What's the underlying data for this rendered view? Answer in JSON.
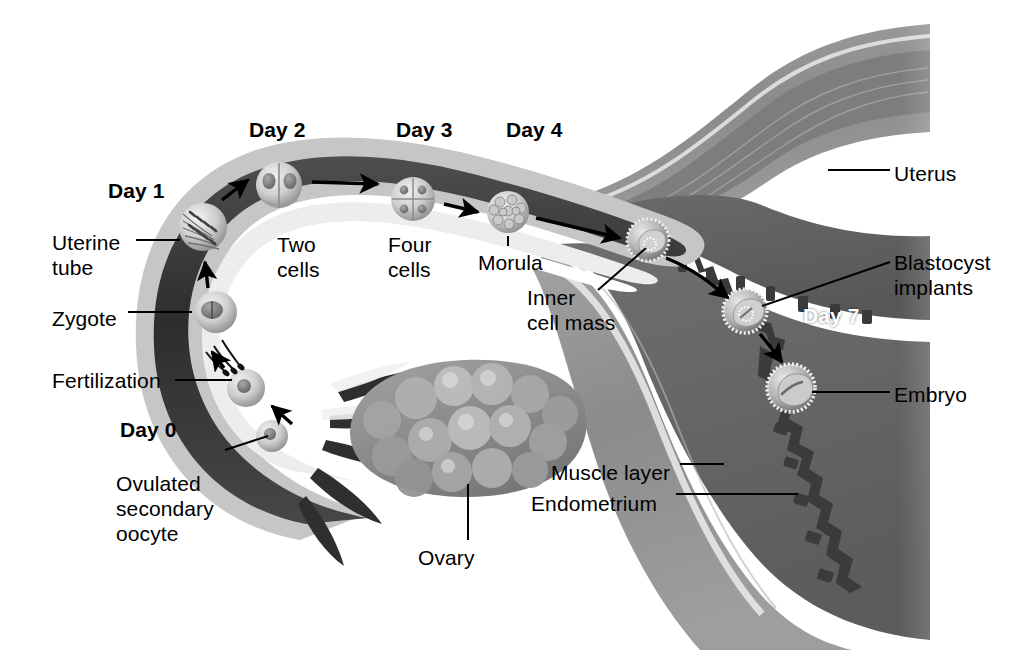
{
  "figure": {
    "domain_note": "anatomical diagram of uterine tube, ovary and uterus",
    "background_color": "#ffffff",
    "ink_color": "#000000",
    "highlight_color": "#ffffff"
  },
  "day_markers": [
    {
      "id": "day0",
      "label": "Day 0",
      "x": 120,
      "y": 417,
      "bold": true,
      "color": "#000000"
    },
    {
      "id": "day1",
      "label": "Day 1",
      "x": 108,
      "y": 178,
      "bold": true,
      "color": "#000000"
    },
    {
      "id": "day2",
      "label": "Day 2",
      "x": 249,
      "y": 117,
      "bold": true,
      "color": "#000000"
    },
    {
      "id": "day3",
      "label": "Day 3",
      "x": 396,
      "y": 117,
      "bold": true,
      "color": "#000000"
    },
    {
      "id": "day4",
      "label": "Day 4",
      "x": 506,
      "y": 117,
      "bold": true,
      "color": "#000000"
    },
    {
      "id": "day7",
      "label": "Day 7",
      "x": 803,
      "y": 303,
      "bold": true,
      "color": "#ffffff"
    }
  ],
  "labels": [
    {
      "id": "uterine-tube",
      "lines": [
        "Uterine",
        "tube"
      ],
      "x": 52,
      "y": 230,
      "align": "left"
    },
    {
      "id": "zygote",
      "lines": [
        "Zygote"
      ],
      "x": 52,
      "y": 306,
      "align": "left"
    },
    {
      "id": "fertilization",
      "lines": [
        "Fertilization"
      ],
      "x": 52,
      "y": 368,
      "align": "left"
    },
    {
      "id": "ovulated-secondary-oocyte",
      "lines": [
        "Ovulated",
        "secondary",
        "oocyte"
      ],
      "x": 116,
      "y": 471,
      "align": "left"
    },
    {
      "id": "two-cells",
      "lines": [
        "Two",
        "cells"
      ],
      "x": 277,
      "y": 232,
      "align": "left"
    },
    {
      "id": "four-cells",
      "lines": [
        "Four",
        "cells"
      ],
      "x": 388,
      "y": 232,
      "align": "left"
    },
    {
      "id": "morula",
      "lines": [
        "Morula"
      ],
      "x": 478,
      "y": 250,
      "align": "left"
    },
    {
      "id": "inner-cell-mass",
      "lines": [
        "Inner",
        "cell mass"
      ],
      "x": 527,
      "y": 285,
      "align": "left"
    },
    {
      "id": "ovary",
      "lines": [
        "Ovary"
      ],
      "x": 418,
      "y": 545,
      "align": "left"
    },
    {
      "id": "muscle-layer",
      "lines": [
        "Muscle layer"
      ],
      "x": 551,
      "y": 460,
      "align": "left"
    },
    {
      "id": "endometrium",
      "lines": [
        "Endometrium"
      ],
      "x": 531,
      "y": 491,
      "align": "left"
    },
    {
      "id": "uterus",
      "lines": [
        "Uterus"
      ],
      "x": 894,
      "y": 161,
      "align": "left"
    },
    {
      "id": "blastocyst-implants",
      "lines": [
        "Blastocyst",
        "implants"
      ],
      "x": 894,
      "y": 250,
      "align": "left"
    },
    {
      "id": "embryo",
      "lines": [
        "Embryo"
      ],
      "x": 894,
      "y": 382,
      "align": "left"
    }
  ],
  "structures": [
    {
      "id": "uterine-tube",
      "name": "Uterine tube",
      "tone": "#3a3a3a",
      "rim": "#c9c9c9"
    },
    {
      "id": "ovary",
      "name": "Ovary",
      "tone": "#8a8a8a"
    },
    {
      "id": "uterus",
      "name": "Uterus",
      "tone": "#8e8e8e"
    },
    {
      "id": "muscle-layer",
      "name": "Muscle layer",
      "tone": "#9a9a9a"
    },
    {
      "id": "endometrium",
      "name": "Endometrium",
      "tone": "#6d6d6d"
    },
    {
      "id": "uterine-cavity",
      "name": "Uterine cavity",
      "tone": "#5a5a5a"
    }
  ],
  "developmental_stages": [
    {
      "id": "ovulated-oocyte",
      "name": "Ovulated secondary oocyte",
      "day": "Day 0",
      "cx": 272,
      "cy": 436,
      "r": 16
    },
    {
      "id": "fertilized-oocyte",
      "name": "Fertilization",
      "day": "Day 0",
      "cx": 246,
      "cy": 388,
      "r": 19
    },
    {
      "id": "zygote",
      "name": "Zygote",
      "cx": 216,
      "cy": 312,
      "r": 21,
      "day": "Day 1"
    },
    {
      "id": "cleaving-zygote",
      "name": "Cleaving zygote",
      "cx": 203,
      "cy": 227,
      "r": 24,
      "day": "Day 1"
    },
    {
      "id": "two-cell",
      "name": "Two cells",
      "cx": 279,
      "cy": 185,
      "r": 23,
      "day": "Day 2"
    },
    {
      "id": "four-cell",
      "name": "Four cells",
      "cx": 413,
      "cy": 199,
      "r": 22,
      "day": "Day 3"
    },
    {
      "id": "morula",
      "name": "Morula",
      "cx": 508,
      "cy": 212,
      "r": 21,
      "day": "Day 4"
    },
    {
      "id": "blastocyst",
      "name": "Blastocyst with inner cell mass",
      "cx": 648,
      "cy": 240,
      "r": 21
    },
    {
      "id": "blastocyst-implanting",
      "name": "Blastocyst implants",
      "cx": 745,
      "cy": 311,
      "r": 22,
      "day": "Day 7"
    },
    {
      "id": "embryo",
      "name": "Embryo",
      "cx": 791,
      "cy": 388,
      "r": 24
    }
  ],
  "arrows": [
    {
      "id": "arrow-ovulation",
      "from": "ovulated-oocyte",
      "to": "fertilized-oocyte"
    },
    {
      "id": "arrow-fertilization",
      "from": "fertilized-oocyte",
      "to": "zygote"
    },
    {
      "id": "arrow-zygote-cleave",
      "from": "zygote",
      "to": "cleaving-zygote"
    },
    {
      "id": "arrow-to-two-cell",
      "from": "cleaving-zygote",
      "to": "two-cell"
    },
    {
      "id": "arrow-two-to-four",
      "from": "two-cell",
      "to": "four-cell"
    },
    {
      "id": "arrow-four-to-morula",
      "from": "four-cell",
      "to": "morula"
    },
    {
      "id": "arrow-morula-to-blastocyst",
      "from": "morula",
      "to": "blastocyst"
    },
    {
      "id": "arrow-blastocyst-to-implant",
      "from": "blastocyst",
      "to": "blastocyst-implanting"
    },
    {
      "id": "arrow-implant-to-embryo",
      "from": "blastocyst-implanting",
      "to": "embryo"
    }
  ]
}
